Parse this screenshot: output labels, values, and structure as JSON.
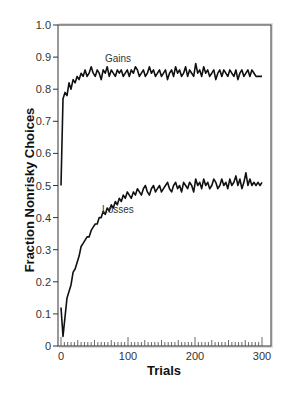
{
  "chart_data": {
    "type": "line",
    "title": "",
    "xlabel": "Trials",
    "ylabel": "Fraction Nonrisky Choices",
    "xlim": [
      0,
      300
    ],
    "ylim": [
      0,
      1.0
    ],
    "x_ticks": [
      0,
      100,
      200,
      300
    ],
    "x_tick_labels": [
      "0",
      "100",
      "200",
      "300"
    ],
    "x_minor_tick_step": 5,
    "y_ticks": [
      0,
      0.1,
      0.2,
      0.3,
      0.4,
      0.5,
      0.6,
      0.7,
      0.8,
      0.9,
      1.0
    ],
    "y_tick_labels": [
      "0",
      "0.1",
      "0.2",
      "0.3",
      "0.4",
      "0.5",
      "0.6",
      "0.7",
      "0.8",
      "0.9",
      "1.0"
    ],
    "grid": false,
    "legend": "none (inline annotations)",
    "annotations": [
      {
        "text": "Gains",
        "x": 85,
        "y": 0.885
      },
      {
        "text": "Losses",
        "x": 85,
        "y": 0.415
      }
    ],
    "series": [
      {
        "name": "Gains",
        "x": [
          0,
          3,
          6,
          9,
          12,
          15,
          18,
          21,
          24,
          27,
          30,
          33,
          36,
          39,
          42,
          45,
          48,
          51,
          54,
          57,
          60,
          63,
          66,
          69,
          72,
          75,
          78,
          81,
          84,
          87,
          90,
          93,
          96,
          99,
          102,
          105,
          108,
          111,
          114,
          117,
          120,
          123,
          126,
          129,
          132,
          135,
          138,
          141,
          144,
          147,
          150,
          153,
          156,
          159,
          162,
          165,
          168,
          171,
          174,
          177,
          180,
          183,
          186,
          189,
          192,
          195,
          198,
          201,
          204,
          207,
          210,
          213,
          216,
          219,
          222,
          225,
          228,
          231,
          234,
          237,
          240,
          243,
          246,
          249,
          252,
          255,
          258,
          261,
          264,
          267,
          270,
          273,
          276,
          279,
          282,
          285,
          288,
          291,
          294,
          297,
          300
        ],
        "values": [
          0.5,
          0.77,
          0.79,
          0.78,
          0.82,
          0.8,
          0.83,
          0.82,
          0.84,
          0.83,
          0.85,
          0.84,
          0.86,
          0.84,
          0.85,
          0.87,
          0.85,
          0.84,
          0.86,
          0.85,
          0.83,
          0.86,
          0.85,
          0.87,
          0.84,
          0.86,
          0.85,
          0.84,
          0.86,
          0.85,
          0.86,
          0.84,
          0.85,
          0.86,
          0.84,
          0.86,
          0.85,
          0.87,
          0.86,
          0.84,
          0.85,
          0.86,
          0.84,
          0.85,
          0.87,
          0.85,
          0.86,
          0.84,
          0.85,
          0.86,
          0.84,
          0.85,
          0.86,
          0.83,
          0.85,
          0.86,
          0.84,
          0.87,
          0.85,
          0.86,
          0.84,
          0.85,
          0.87,
          0.84,
          0.86,
          0.85,
          0.84,
          0.88,
          0.85,
          0.86,
          0.84,
          0.87,
          0.85,
          0.86,
          0.84,
          0.85,
          0.86,
          0.83,
          0.85,
          0.86,
          0.84,
          0.86,
          0.85,
          0.84,
          0.86,
          0.85,
          0.84,
          0.86,
          0.83,
          0.85,
          0.86,
          0.84,
          0.85,
          0.86,
          0.84,
          0.86,
          0.85,
          0.84,
          0.84,
          0.84,
          0.84
        ],
        "color": "#111111"
      },
      {
        "name": "Losses",
        "x": [
          0,
          3,
          6,
          9,
          12,
          15,
          18,
          21,
          24,
          27,
          30,
          33,
          36,
          39,
          42,
          45,
          48,
          51,
          54,
          57,
          60,
          63,
          66,
          69,
          72,
          75,
          78,
          81,
          84,
          87,
          90,
          93,
          96,
          99,
          102,
          105,
          108,
          111,
          114,
          117,
          120,
          123,
          126,
          129,
          132,
          135,
          138,
          141,
          144,
          147,
          150,
          153,
          156,
          159,
          162,
          165,
          168,
          171,
          174,
          177,
          180,
          183,
          186,
          189,
          192,
          195,
          198,
          201,
          204,
          207,
          210,
          213,
          216,
          219,
          222,
          225,
          228,
          231,
          234,
          237,
          240,
          243,
          246,
          249,
          252,
          255,
          258,
          261,
          264,
          267,
          270,
          273,
          276,
          279,
          282,
          285,
          288,
          291,
          294,
          297,
          300
        ],
        "values": [
          0.12,
          0.03,
          0.09,
          0.15,
          0.17,
          0.19,
          0.23,
          0.24,
          0.26,
          0.28,
          0.31,
          0.32,
          0.33,
          0.34,
          0.34,
          0.36,
          0.37,
          0.38,
          0.38,
          0.4,
          0.4,
          0.42,
          0.41,
          0.43,
          0.42,
          0.44,
          0.43,
          0.45,
          0.44,
          0.46,
          0.45,
          0.47,
          0.46,
          0.48,
          0.47,
          0.46,
          0.48,
          0.47,
          0.49,
          0.48,
          0.47,
          0.49,
          0.5,
          0.48,
          0.47,
          0.49,
          0.5,
          0.48,
          0.49,
          0.5,
          0.48,
          0.49,
          0.5,
          0.51,
          0.49,
          0.48,
          0.5,
          0.51,
          0.49,
          0.5,
          0.48,
          0.51,
          0.5,
          0.49,
          0.51,
          0.5,
          0.48,
          0.52,
          0.5,
          0.51,
          0.49,
          0.52,
          0.5,
          0.51,
          0.49,
          0.5,
          0.52,
          0.51,
          0.49,
          0.5,
          0.52,
          0.5,
          0.51,
          0.49,
          0.52,
          0.5,
          0.51,
          0.53,
          0.5,
          0.52,
          0.49,
          0.51,
          0.54,
          0.5,
          0.52,
          0.5,
          0.51,
          0.5,
          0.51,
          0.5,
          0.51
        ],
        "color": "#111111"
      }
    ]
  }
}
